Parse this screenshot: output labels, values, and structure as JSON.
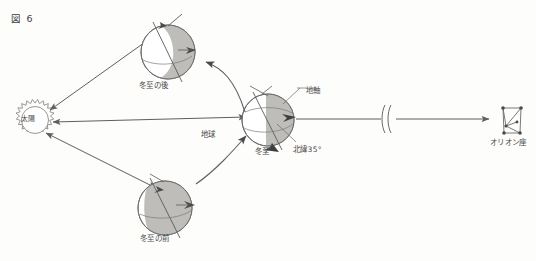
{
  "figure": {
    "title": "図 6",
    "caption_number": "6",
    "background": "#fdfdfc",
    "ink_color": "#6b6b6b",
    "shadow_color": "#a8a6a3"
  },
  "labels": {
    "sun": "太陽",
    "earth": "地球",
    "winter_solstice": "冬至",
    "after_winter_solstice": "冬至の後",
    "before_winter_solstice": "冬至の前",
    "earth_axis": "地軸",
    "latitude_35n": "北緯35°",
    "orion": "オリオン座"
  },
  "objects": {
    "sun": {
      "name": "太陽",
      "cx": 35,
      "cy": 120,
      "r": 17,
      "spikes": 14,
      "style": "sun-burst"
    },
    "earths": [
      {
        "id": "earth-after",
        "label": "冬至の後",
        "cx": 168,
        "cy": 52,
        "r": 27,
        "axis_tilt_deg": 23.4,
        "shadow_side": "right",
        "shadow_fraction": 0.48
      },
      {
        "id": "earth-solstice",
        "label": "地球",
        "cx": 268,
        "cy": 120,
        "r": 26,
        "axis_tilt_deg": 23.4,
        "shadow_side": "right",
        "shadow_fraction": 0.5,
        "sub_label": "冬至",
        "axis_label": "地軸",
        "latitude_label": "北緯35°"
      },
      {
        "id": "earth-before",
        "label": "冬至の前",
        "cx": 165,
        "cy": 208,
        "r": 27,
        "axis_tilt_deg": 23.4,
        "shadow_side": "right",
        "shadow_fraction": 0.78
      }
    ],
    "orion": {
      "name": "オリオン座",
      "cx": 512,
      "cy": 120,
      "shape": "hourglass",
      "star_count": 6
    },
    "break_mark": {
      "x": 388,
      "y": 120,
      "type": "double-slash",
      "meaning": "distance-not-to-scale"
    }
  },
  "connections": [
    {
      "id": "sun-to-earth-after",
      "from": "sun",
      "to": "earth-after",
      "arrow": "double"
    },
    {
      "id": "sun-to-earth-solstice",
      "from": "sun",
      "to": "earth-solstice",
      "arrow": "double"
    },
    {
      "id": "sun-to-earth-before",
      "from": "sun",
      "to": "earth-before",
      "arrow": "double"
    },
    {
      "id": "orbit-arrow-upper",
      "from": "earth-solstice",
      "to": "earth-after",
      "arrow": "curved-single"
    },
    {
      "id": "orbit-arrow-lower",
      "from": "earth-before",
      "to": "earth-solstice",
      "arrow": "curved-single"
    },
    {
      "id": "earth-to-orion",
      "from": "earth-solstice",
      "to": "orion",
      "arrow": "single",
      "has_break": true
    }
  ]
}
